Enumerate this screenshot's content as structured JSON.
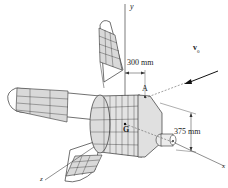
{
  "figure": {
    "axes": {
      "y": "y",
      "x": "x",
      "z": "z"
    },
    "points": {
      "A": "A",
      "G": "G"
    },
    "dimensions": {
      "offset": "300 mm",
      "height": "375 mm"
    },
    "velocity": {
      "symbol": "v",
      "subscript": "0"
    },
    "colors": {
      "line": "#333333",
      "panel_fill": "#d9d9d9",
      "body_fill": "#e6e6e6",
      "cone_fill": "#dedede"
    }
  }
}
